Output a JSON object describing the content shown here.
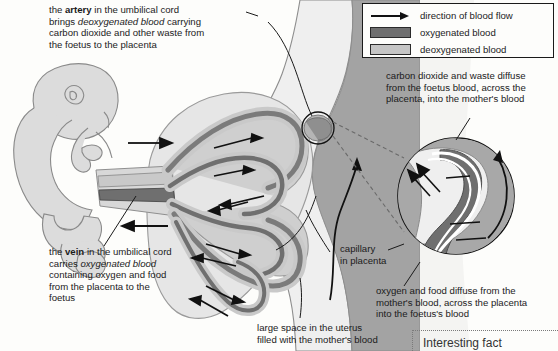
{
  "title": "Placenta and umbilical cord blood flow diagram",
  "legend": {
    "flow_label": "direction of blood flow",
    "oxygenated_label": "oxygenated blood",
    "deoxygenated_label": "deoxygenated blood",
    "oxygenated_color": "#6f6f6f",
    "deoxygenated_color": "#c5c5c5",
    "arrow_icon": "right-arrow-icon"
  },
  "annotations": {
    "artery": "the artery in the umbilical cord\nbrings deoxygenated blood carrying\ncarbon dioxide and other waste from\nthe foetus to the placenta",
    "artery_bold_word": "artery",
    "artery_italic_phrase": "deoxygenated blood",
    "vein": "the vein in the umbilical cord\ncarries oxygenated blood\ncontaining oxygen and food\nfrom the placenta to the\nfoetus",
    "vein_bold_word": "vein",
    "vein_italic_phrase": "oxygenated blood",
    "co2_diffusion": "carbon dioxide and waste diffuse\nfrom the foetus blood, across the\nplacenta, into the mother's blood",
    "o2_diffusion": "oxygen and food diffuse from the\nmother's blood, across the placenta\ninto the foetus's blood",
    "capillary": "capillary\nin placenta",
    "uterus_space": "large space in the uterus\nfilled with the mother's blood"
  },
  "fact_box": {
    "label": "Interesting fact"
  },
  "figure_parts": {
    "foetus": "foetus-figure",
    "umbilical_cord": "umbilical-cord",
    "placenta": "placenta",
    "uterus_wall": "uterus-wall",
    "magnifier": "capillary-magnified-inset"
  }
}
